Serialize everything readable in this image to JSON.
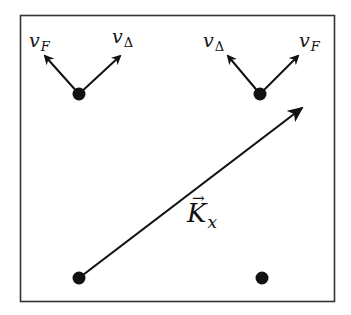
{
  "diagram": {
    "frame": {
      "x": 20,
      "y": 15,
      "width": 315,
      "height": 287,
      "stroke": "#333333"
    },
    "points": [
      {
        "id": "top-left",
        "x": 79,
        "y": 94
      },
      {
        "id": "top-right",
        "x": 260,
        "y": 94
      },
      {
        "id": "bottom-left",
        "x": 79,
        "y": 278
      },
      {
        "id": "bottom-right",
        "x": 262,
        "y": 278
      }
    ],
    "labels": {
      "top_left_left": {
        "base": "v",
        "sub": "F"
      },
      "top_left_right": {
        "base": "v",
        "sub": "Δ"
      },
      "top_right_left": {
        "base": "v",
        "sub": "Δ"
      },
      "top_right_right": {
        "base": "v",
        "sub": "F"
      },
      "vector": {
        "arrow": "→",
        "base": "K",
        "sub": "x"
      }
    },
    "colors": {
      "ink": "#111111",
      "background": "#ffffff"
    }
  }
}
